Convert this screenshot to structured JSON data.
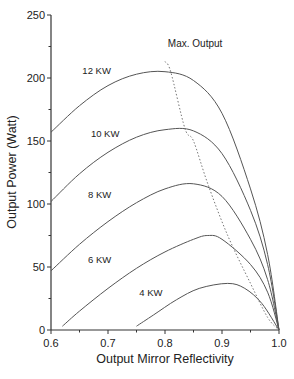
{
  "chart_data": {
    "type": "line",
    "title": "",
    "xlabel": "Output Mirror Reflectivity",
    "ylabel": "Output Power (Watt)",
    "xlim": [
      0.6,
      1.0
    ],
    "ylim": [
      0,
      250
    ],
    "xticks": [
      "0.6",
      "0.7",
      "0.8",
      "0.9",
      "1.0"
    ],
    "yticks": [
      "0",
      "50",
      "100",
      "150",
      "200",
      "250"
    ],
    "grid": false,
    "legend": "inline labels",
    "series": [
      {
        "name": "12 KW",
        "label_pos": [
          0.655,
          203
        ],
        "x": [
          0.6,
          0.65,
          0.7,
          0.75,
          0.8,
          0.85,
          0.9,
          0.95,
          0.98,
          1.0
        ],
        "y": [
          157,
          178,
          194,
          203,
          205,
          198,
          172,
          112,
          60,
          0
        ]
      },
      {
        "name": "10 KW",
        "label_pos": [
          0.67,
          153
        ],
        "x": [
          0.6,
          0.65,
          0.7,
          0.75,
          0.8,
          0.85,
          0.9,
          0.95,
          0.98,
          1.0
        ],
        "y": [
          102,
          124,
          141,
          153,
          159,
          158,
          140,
          95,
          52,
          0
        ]
      },
      {
        "name": "8 KW",
        "label_pos": [
          0.665,
          105
        ],
        "x": [
          0.6,
          0.65,
          0.7,
          0.75,
          0.8,
          0.85,
          0.9,
          0.95,
          0.98,
          1.0
        ],
        "y": [
          47,
          68,
          86,
          101,
          112,
          116,
          106,
          72,
          40,
          0
        ]
      },
      {
        "name": "6 KW",
        "label_pos": [
          0.665,
          53
        ],
        "x": [
          0.62,
          0.65,
          0.7,
          0.75,
          0.8,
          0.85,
          0.875,
          0.9,
          0.95,
          0.98,
          1.0
        ],
        "y": [
          3,
          15,
          33,
          49,
          62,
          72,
          75,
          72,
          52,
          30,
          0
        ]
      },
      {
        "name": "4 KW",
        "label_pos": [
          0.755,
          27
        ],
        "x": [
          0.75,
          0.78,
          0.82,
          0.86,
          0.91,
          0.94,
          0.97,
          1.0
        ],
        "y": [
          3,
          12,
          24,
          33,
          37,
          33,
          21,
          0
        ]
      }
    ],
    "annotations": [
      {
        "text": "Max. Output",
        "pos": [
          0.805,
          225
        ],
        "line_style": "dotted",
        "x": [
          0.8,
          0.81,
          0.835,
          0.85,
          0.875,
          0.91,
          0.95,
          0.98,
          1.0
        ],
        "y": [
          213,
          205,
          160,
          150,
          116,
          75,
          37,
          10,
          0
        ]
      }
    ]
  }
}
